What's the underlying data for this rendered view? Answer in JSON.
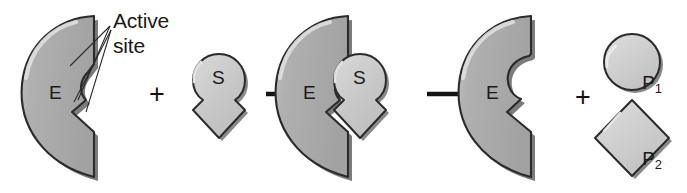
{
  "figure": {
    "type": "enzyme-substrate-reaction-diagram",
    "background_color": "#ffffff",
    "outline_color": "#2b2b2b",
    "enzyme_fill": "#a9a9a9",
    "enzyme_shadow": "#7c7c7c",
    "enzyme_highlight": "#d2d2d2",
    "substrate_fill": "#c9c9c9",
    "product_fill": "#cdcdcd",
    "text_color": "#1a1a1a"
  },
  "annotation": {
    "line1": "Active",
    "line2": "site",
    "pointer_count": 2
  },
  "steps": [
    {
      "name": "free-enzyme-and-substrate",
      "enzyme_label": "E",
      "operator": "+",
      "substrate_label": "S"
    },
    {
      "name": "enzyme-substrate-complex",
      "enzyme_label": "E",
      "substrate_label": "S"
    },
    {
      "name": "enzyme-and-products",
      "enzyme_label": "E",
      "operator": "+",
      "products": [
        {
          "label": "P",
          "subscript": "1",
          "shape": "circle"
        },
        {
          "label": "P",
          "subscript": "2",
          "shape": "diamond"
        }
      ]
    }
  ],
  "arrows": [
    {
      "name": "arrow-binding",
      "direction": "right"
    },
    {
      "name": "arrow-catalysis",
      "direction": "right"
    }
  ]
}
